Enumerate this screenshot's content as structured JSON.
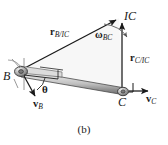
{
  "figure": {
    "caption": "(b)",
    "points": {
      "ic": {
        "label": "IC",
        "x": 119,
        "y": 18
      },
      "b": {
        "label": "B",
        "x": 18,
        "y": 72
      },
      "c": {
        "label": "C",
        "x": 123,
        "y": 92
      }
    },
    "vectors": [
      {
        "name": "r-b-ic",
        "symbol": "r",
        "subscript": "B/IC",
        "label": "rB/IC",
        "from": "B",
        "to": "IC",
        "description": "position vector from IC to B"
      },
      {
        "name": "r-c-ic",
        "symbol": "r",
        "subscript": "C/IC",
        "label": "rC/IC",
        "from": "C",
        "to": "IC",
        "description": "position vector from IC to C"
      },
      {
        "name": "v-b",
        "symbol": "v",
        "subscript": "B",
        "label": "vB",
        "at": "B",
        "direction": "down-left",
        "description": "velocity of point B"
      },
      {
        "name": "v-c",
        "symbol": "v",
        "subscript": "C",
        "label": "vC",
        "at": "C",
        "direction": "right",
        "description": "velocity of point C"
      }
    ],
    "angular_velocity": {
      "symbol": "ω",
      "subscript": "BC",
      "label": "ωBC",
      "sense": "clockwise",
      "description": "angular velocity of link BC"
    },
    "angle": {
      "symbol": "θ",
      "at": "B",
      "description": "angle between link BC and velocity vB"
    },
    "link": {
      "name": "link-bc",
      "from": "B",
      "to": "C",
      "description": "rigid rod connecting B and C"
    },
    "right_angle_marks": [
      {
        "at": "C",
        "between": [
          "r-c-ic",
          "v-c"
        ]
      },
      {
        "at": "B",
        "between": [
          "r-b-ic",
          "v-b"
        ]
      }
    ],
    "colors": {
      "line": "#1a1a1a",
      "rod_light": "#e8e8e8",
      "rod_mid": "#b8b8b8",
      "rod_dark": "#6e6e6e",
      "joint": "#8a8a8a",
      "triangle_fill": "#f2f2f2",
      "background": "#ffffff"
    }
  }
}
